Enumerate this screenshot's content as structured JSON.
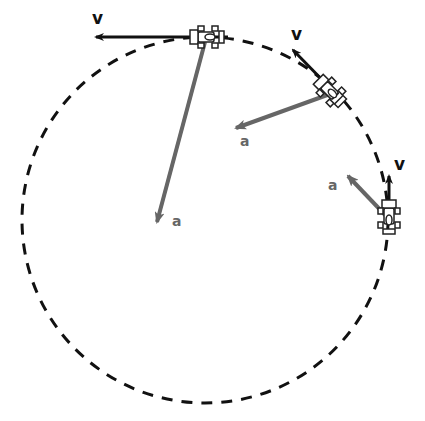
{
  "diagram": {
    "path": {
      "style": "dashed",
      "color": "#111111"
    },
    "velocity_label": "v",
    "acceleration_label": "a",
    "colors": {
      "velocity": "#111111",
      "acceleration": "#666666",
      "car_outline": "#222222",
      "car_fill": "#ffffff"
    },
    "cars": [
      {
        "id": "car-top",
        "angle_deg": 90,
        "v_label": "v",
        "a_label": "a"
      },
      {
        "id": "car-upper-right",
        "angle_deg": 45,
        "v_label": "v",
        "a_label": "a"
      },
      {
        "id": "car-right",
        "angle_deg": 5,
        "v_label": "v",
        "a_label": "a"
      }
    ]
  }
}
